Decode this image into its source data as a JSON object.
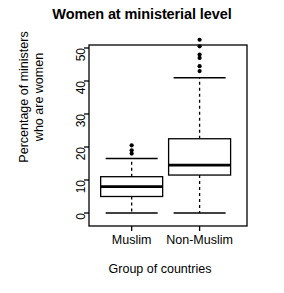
{
  "chart_data": {
    "type": "box",
    "title": "Women at ministerial level",
    "xlabel": "Group of countries",
    "ylabel_line1": "Percentage of ministers",
    "ylabel_line2": "who are women",
    "categories": [
      "Muslim",
      "Non-Muslim"
    ],
    "ylim": [
      -2,
      55
    ],
    "yticks": [
      0,
      10,
      20,
      30,
      40,
      50
    ],
    "ytick_labels": [
      "0",
      "10",
      "20",
      "30",
      "40",
      "50"
    ],
    "grid": false,
    "legend": "none",
    "box_color": "#000000",
    "fill_color": "#ffffff",
    "series": [
      {
        "name": "Muslim",
        "min_whisker": 0.0,
        "q1": 5.0,
        "median": 8.0,
        "q3": 11.0,
        "max_whisker": 16.5,
        "outliers": [
          18.0,
          19.0,
          20.5
        ]
      },
      {
        "name": "Non-Muslim",
        "min_whisker": 0.0,
        "q1": 11.5,
        "median": 14.5,
        "q3": 22.5,
        "max_whisker": 41.0,
        "outliers": [
          43.0,
          44.5,
          47.0,
          48.0,
          50.5,
          52.5
        ]
      }
    ]
  }
}
